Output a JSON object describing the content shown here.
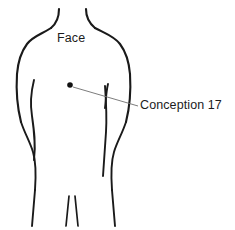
{
  "figure": {
    "type": "anatomical-line-drawing",
    "background_color": "#ffffff",
    "outline_color": "#1a1a1a",
    "leader_line_color": "#6d6d6d",
    "point_marker_color": "#111111"
  },
  "labels": {
    "face": "Face",
    "point": "Conception 17"
  },
  "point_marker": {
    "name": "Conception 17",
    "x": 70,
    "y": 85,
    "radius": 2.8
  },
  "leader": {
    "from_x": 73,
    "from_y": 87,
    "to_x": 138,
    "to_y": 106
  }
}
